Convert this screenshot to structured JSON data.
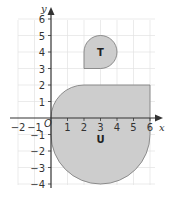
{
  "axes": {
    "x_label": "x",
    "y_label": "y",
    "origin_label": "O",
    "x_ticks": [
      "−2",
      "−1",
      "1",
      "2",
      "3",
      "4",
      "5",
      "6"
    ],
    "y_ticks": [
      "6",
      "5",
      "4",
      "3",
      "2",
      "1",
      "−1",
      "−2",
      "−3",
      "−4"
    ]
  },
  "shapes": {
    "t_label": "T",
    "u_label": "U"
  },
  "colors": {
    "fill": "#cdcdcd",
    "stroke": "#777777",
    "grid": "#e2e2e2",
    "axis": "#333333"
  }
}
